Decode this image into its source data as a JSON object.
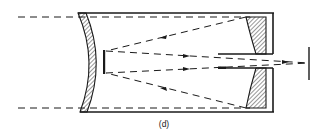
{
  "diagram": {
    "type": "optical-schematic",
    "caption": "(d)",
    "components": [
      {
        "id": "corrector-plate",
        "label": "curved hatched corrector lens (left)"
      },
      {
        "id": "secondary-mirror",
        "label": "small secondary mirror"
      },
      {
        "id": "primary-mirror",
        "label": "hatched primary mirror with central hole (right)"
      },
      {
        "id": "baffle-tube",
        "label": "central baffle tube"
      },
      {
        "id": "focal-plane",
        "label": "focal plane line"
      },
      {
        "id": "tube",
        "label": "telescope tube"
      }
    ],
    "colors": {
      "line": "#1a1a1a",
      "background": "#ffffff"
    }
  }
}
